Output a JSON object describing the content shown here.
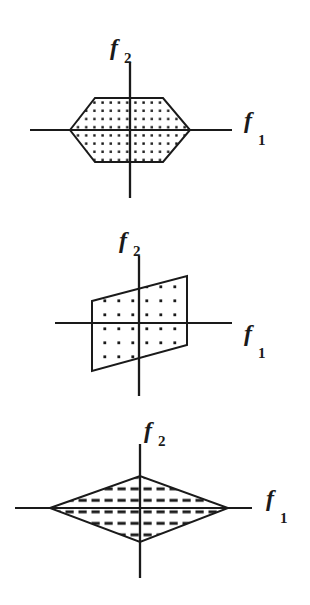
{
  "figure": {
    "background_color": "#ffffff",
    "ink_color": "#1a1a1a",
    "panels": [
      {
        "id": "panel-hexagon",
        "shape_name": "hexagon",
        "fill_pattern": "dots",
        "axis_x_label": "f",
        "axis_x_subscript": "1",
        "axis_y_label": "f",
        "axis_y_subscript": "2",
        "origin": {
          "x": 130,
          "y": 130
        },
        "axis_x_from": 30,
        "axis_x_to": 232,
        "axis_y_from": 62,
        "axis_y_to": 198,
        "vertices": [
          {
            "x": 70,
            "y": 130
          },
          {
            "x": 95,
            "y": 98
          },
          {
            "x": 163,
            "y": 98
          },
          {
            "x": 190,
            "y": 130
          },
          {
            "x": 163,
            "y": 162
          },
          {
            "x": 95,
            "y": 162
          }
        ]
      },
      {
        "id": "panel-parallelogram",
        "shape_name": "parallelogram",
        "fill_pattern": "dots",
        "axis_x_label": "f",
        "axis_x_subscript": "1",
        "axis_y_label": "f",
        "axis_y_subscript": "2",
        "origin": {
          "x": 139,
          "y": 323
        },
        "axis_x_from": 55,
        "axis_x_to": 232,
        "axis_y_from": 256,
        "axis_y_to": 396,
        "vertices": [
          {
            "x": 92,
            "y": 301
          },
          {
            "x": 187,
            "y": 276
          },
          {
            "x": 187,
            "y": 345
          },
          {
            "x": 92,
            "y": 371
          }
        ]
      },
      {
        "id": "panel-diamond",
        "shape_name": "diamond",
        "fill_pattern": "dashes",
        "axis_x_label": "f",
        "axis_x_subscript": "1",
        "axis_y_label": "f",
        "axis_y_subscript": "2",
        "origin": {
          "x": 140,
          "y": 508
        },
        "axis_x_from": 15,
        "axis_x_to": 252,
        "axis_y_from": 444,
        "axis_y_to": 578,
        "vertices": [
          {
            "x": 50,
            "y": 508
          },
          {
            "x": 140,
            "y": 476
          },
          {
            "x": 228,
            "y": 508
          },
          {
            "x": 140,
            "y": 542
          }
        ]
      }
    ]
  }
}
